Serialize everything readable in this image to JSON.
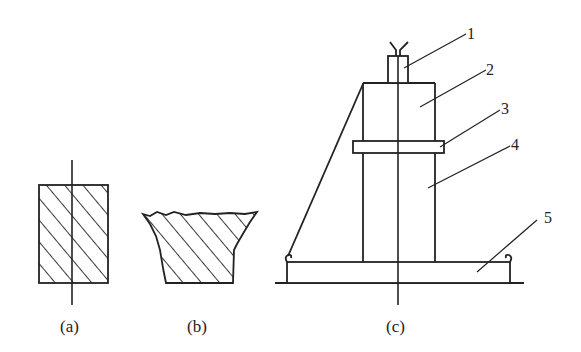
{
  "diagram": {
    "type": "technical-drawing",
    "subfigures": [
      {
        "id": "a",
        "caption": "(a)",
        "description": "rectangular hatched specimen with center axis"
      },
      {
        "id": "b",
        "caption": "(b)",
        "description": "tapered hatched specimen with broken top surface"
      },
      {
        "id": "c",
        "caption": "(c)",
        "description": "apparatus assembly with numbered parts"
      }
    ],
    "callouts": [
      {
        "number": "1"
      },
      {
        "number": "2"
      },
      {
        "number": "3"
      },
      {
        "number": "4"
      },
      {
        "number": "5"
      }
    ],
    "colors": {
      "line": "#222222",
      "background": "#ffffff"
    }
  }
}
